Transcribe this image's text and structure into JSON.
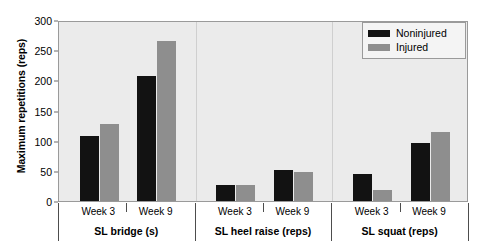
{
  "chart_data": {
    "type": "bar",
    "title": "",
    "xlabel": "",
    "ylabel": "Maximum repetitions (reps)",
    "ylim": [
      0,
      300
    ],
    "yticks": [
      0,
      50,
      100,
      150,
      200,
      250,
      300
    ],
    "grid": false,
    "legend_position": "top-right",
    "categories": [
      "SL bridge (s) - Week 3",
      "SL bridge (s) - Week 9",
      "SL heel raise (reps) - Week 3",
      "SL heel raise (reps) - Week 9",
      "SL squat (reps) - Week 3",
      "SL squat (reps) - Week 9"
    ],
    "series": [
      {
        "name": "Noninjured",
        "color": "#121212",
        "values": [
          107,
          208,
          26,
          52,
          44,
          96
        ]
      },
      {
        "name": "Injured",
        "color": "#8e8e8e",
        "values": [
          127,
          265,
          26,
          48,
          19,
          115
        ]
      }
    ],
    "groups": [
      {
        "label": "SL bridge (s)",
        "ticks": [
          "Week 3",
          "Week 9"
        ]
      },
      {
        "label": "SL heel raise (reps)",
        "ticks": [
          "Week 3",
          "Week 9"
        ]
      },
      {
        "label": "SL squat (reps)",
        "ticks": [
          "Week 3",
          "Week 9"
        ]
      }
    ]
  },
  "legend": {
    "items": [
      {
        "label": "Noninjured",
        "color": "#121212"
      },
      {
        "label": "Injured",
        "color": "#8e8e8e"
      }
    ]
  },
  "axis": {
    "y_title": "Maximum repetitions (reps)",
    "y_tick_labels": [
      "0",
      "50",
      "100",
      "150",
      "200",
      "250",
      "300"
    ]
  },
  "x_tick_labels": [
    "Week 3",
    "Week 9",
    "Week 3",
    "Week 9",
    "Week 3",
    "Week 9"
  ],
  "group_labels": [
    "SL bridge (s)",
    "SL heel raise (reps)",
    "SL squat (reps)"
  ],
  "colors": {
    "noninjured": "#121212",
    "injured": "#8e8e8e",
    "plot_background": "#ebebeb",
    "frame": "#9a9a9a",
    "page_background": "#ffffff"
  }
}
